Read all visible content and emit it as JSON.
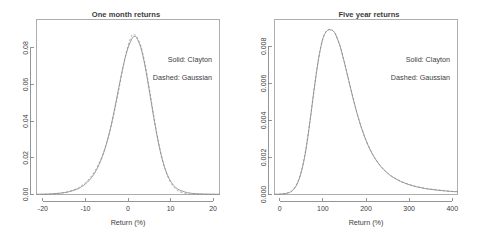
{
  "figure": {
    "background": "#ffffff",
    "panel_count": 2,
    "axis_color": "#7a7a7a",
    "curve_color": "#8a8a8a"
  },
  "chart_data": [
    {
      "type": "line",
      "title": "One month returns",
      "xlabel": "Return (%)",
      "ylabel": "",
      "xlim": [
        -21.5,
        21.5
      ],
      "ylim": [
        0,
        0.0955
      ],
      "xticks": [
        -20,
        -10,
        0,
        10,
        20
      ],
      "xticklabels": [
        "-20",
        "-10",
        "0",
        "10",
        "20"
      ],
      "yticks": [
        0.0,
        0.02,
        0.04,
        0.06,
        0.08
      ],
      "yticklabels": [
        "0.00",
        "0.02",
        "0.04",
        "0.06",
        "0.08"
      ],
      "grid": false,
      "legend_position": "upper-right-inside",
      "annotations": [
        "Solid: Clayton",
        "Dashed: Gaussian"
      ],
      "series": [
        {
          "name": "Clayton",
          "style": "solid",
          "x": [
            -21.5,
            -20,
            -18,
            -16,
            -14,
            -12,
            -11,
            -10,
            -9,
            -8,
            -7,
            -6,
            -5,
            -4,
            -3,
            -2,
            -1,
            0,
            1,
            1.5,
            2,
            3,
            4,
            5,
            6,
            7,
            8,
            9,
            10,
            11,
            12,
            14,
            16,
            18,
            20,
            21.5
          ],
          "y": [
            0.00012,
            0.00018,
            0.00035,
            0.00072,
            0.00145,
            0.0029,
            0.0041,
            0.00575,
            0.008,
            0.0111,
            0.0153,
            0.0209,
            0.0282,
            0.0374,
            0.0484,
            0.0603,
            0.0714,
            0.08,
            0.0853,
            0.0862,
            0.0856,
            0.0802,
            0.0701,
            0.0568,
            0.0427,
            0.0299,
            0.0196,
            0.0122,
            0.0073,
            0.0043,
            0.00255,
            0.00098,
            0.00045,
            0.00026,
            0.00018,
            0.00015
          ]
        },
        {
          "name": "Gaussian",
          "style": "dashed",
          "x": [
            -21.5,
            -20,
            -18,
            -16,
            -14,
            -12,
            -11,
            -10,
            -9,
            -8,
            -7,
            -6,
            -5,
            -4,
            -3,
            -2,
            -1,
            0,
            0.9,
            1.5,
            2,
            3,
            4,
            5,
            6,
            7,
            8,
            9,
            10,
            11,
            12,
            14,
            16,
            18,
            20,
            21.5
          ],
          "y": [
            4e-05,
            8e-05,
            0.00024,
            0.00063,
            0.0015,
            0.00325,
            0.00465,
            0.0065,
            0.0089,
            0.012,
            0.0161,
            0.0214,
            0.0282,
            0.0368,
            0.0473,
            0.0592,
            0.0711,
            0.081,
            0.0868,
            0.087,
            0.0864,
            0.0812,
            0.0713,
            0.0581,
            0.0438,
            0.0306,
            0.0198,
            0.0119,
            0.00665,
            0.00345,
            0.00167,
            0.00034,
            6e-05,
            2e-05,
            1e-05,
            1e-05
          ]
        }
      ]
    },
    {
      "type": "line",
      "title": "Five year returns",
      "xlabel": "Return (%)",
      "ylabel": "",
      "xlim": [
        -12,
        412
      ],
      "ylim": [
        0,
        0.00945
      ],
      "xticks": [
        0,
        100,
        200,
        300,
        400
      ],
      "xticklabels": [
        "0",
        "100",
        "200",
        "300",
        "400"
      ],
      "yticks": [
        0.0,
        0.002,
        0.004,
        0.006,
        0.008
      ],
      "yticklabels": [
        "0.000",
        "0.002",
        "0.004",
        "0.006",
        "0.008"
      ],
      "grid": false,
      "legend_position": "upper-right-inside",
      "annotations": [
        "Solid: Clayton",
        "Dashed: Gaussian"
      ],
      "series": [
        {
          "name": "Clayton",
          "style": "solid",
          "x": [
            -12,
            0,
            10,
            20,
            30,
            40,
            50,
            60,
            70,
            80,
            90,
            100,
            110,
            120,
            125,
            130,
            140,
            150,
            160,
            170,
            180,
            190,
            200,
            210,
            220,
            230,
            240,
            250,
            260,
            280,
            300,
            320,
            340,
            360,
            380,
            400,
            412
          ],
          "y": [
            1e-05,
            2e-05,
            4e-05,
            9e-05,
            0.00022,
            0.00055,
            0.0012,
            0.0023,
            0.0039,
            0.0057,
            0.0073,
            0.0084,
            0.00885,
            0.00888,
            0.0088,
            0.00862,
            0.008,
            0.00712,
            0.00615,
            0.0052,
            0.00432,
            0.00356,
            0.00292,
            0.0024,
            0.00198,
            0.00164,
            0.00137,
            0.00115,
            0.00097,
            0.00071,
            0.00053,
            0.0004,
            0.00031,
            0.00025,
            0.0002,
            0.00016,
            0.00015
          ]
        },
        {
          "name": "Gaussian",
          "style": "dashed",
          "x": [
            -12,
            0,
            10,
            20,
            30,
            40,
            50,
            60,
            70,
            80,
            90,
            100,
            110,
            120,
            125,
            130,
            140,
            150,
            160,
            170,
            180,
            190,
            200,
            210,
            220,
            230,
            240,
            250,
            260,
            280,
            300,
            320,
            340,
            360,
            380,
            400,
            412
          ],
          "y": [
            1e-05,
            2e-05,
            4e-05,
            0.0001,
            0.00024,
            0.00058,
            0.00125,
            0.00238,
            0.00396,
            0.00575,
            0.00734,
            0.00842,
            0.00886,
            0.00889,
            0.00881,
            0.00863,
            0.00801,
            0.00713,
            0.00616,
            0.00521,
            0.00433,
            0.00357,
            0.00293,
            0.00241,
            0.00199,
            0.00165,
            0.00138,
            0.00116,
            0.00098,
            0.00072,
            0.00054,
            0.00041,
            0.00032,
            0.00026,
            0.00021,
            0.00017,
            0.00016
          ]
        }
      ]
    }
  ]
}
